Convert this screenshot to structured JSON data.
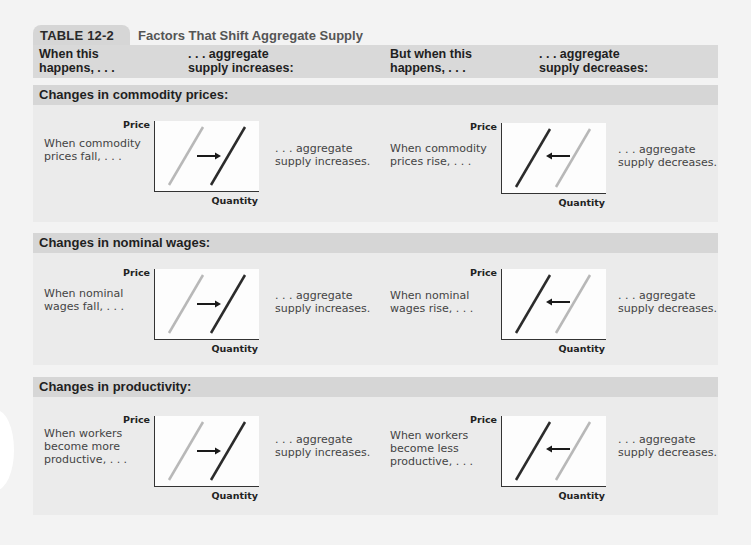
{
  "header": {
    "table_label": "TABLE 12-2",
    "table_title": "Factors That Shift Aggregate Supply"
  },
  "columns": {
    "c1": "When this\nhappens, . . .",
    "c2": ". . . aggregate\nsupply increases:",
    "c3": "But when this\nhappens, . . .",
    "c4": ". . . aggregate\nsupply decreases:"
  },
  "graph_labels": {
    "y": "Price",
    "x": "Quantity"
  },
  "colors": {
    "old_curve": "#b8b8b8",
    "new_curve": "#2b2b2b",
    "arrow": "#1a1a1a"
  },
  "sections": [
    {
      "title": "Changes in commodity prices:",
      "increase": {
        "cause": "When commodity\nprices fall, . . .",
        "effect": ". . . aggregate\nsupply increases.",
        "arrow": "right"
      },
      "decrease": {
        "cause": "When commodity\nprices rise, . . .",
        "effect": ". . . aggregate\nsupply decreases.",
        "arrow": "left"
      }
    },
    {
      "title": "Changes in nominal wages:",
      "increase": {
        "cause": "When nominal\nwages fall, . . .",
        "effect": ". . . aggregate\nsupply increases.",
        "arrow": "right"
      },
      "decrease": {
        "cause": "When nominal\nwages rise, . . .",
        "effect": ". . . aggregate\nsupply decreases.",
        "arrow": "left"
      }
    },
    {
      "title": "Changes in productivity:",
      "increase": {
        "cause": "When workers\nbecome more\nproductive, . . .",
        "effect": ". . . aggregate\nsupply increases.",
        "arrow": "right"
      },
      "decrease": {
        "cause": "When workers\nbecome less\nproductive, . . .",
        "effect": ". . . aggregate\nsupply decreases.",
        "arrow": "left"
      }
    }
  ]
}
